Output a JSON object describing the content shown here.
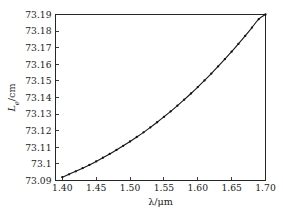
{
  "chart_data": {
    "type": "line",
    "title": "",
    "xlabel": "λ/μm",
    "ylabel": "L_e/cm",
    "ylabel_parts": {
      "symbol": "L",
      "subscript": "e",
      "unit": "/cm"
    },
    "xlabel_parts": {
      "symbol": "λ",
      "unit": "/μm"
    },
    "xlim": [
      1.39,
      1.7
    ],
    "ylim": [
      73.09,
      73.19
    ],
    "xticks": [
      1.4,
      1.45,
      1.5,
      1.55,
      1.6,
      1.65,
      1.7
    ],
    "xticklabels": [
      "1.40",
      "1.45",
      "1.50",
      "1.55",
      "1.60",
      "1.65",
      "1.70"
    ],
    "yticks": [
      73.09,
      73.1,
      73.11,
      73.12,
      73.13,
      73.14,
      73.15,
      73.16,
      73.17,
      73.18,
      73.19
    ],
    "yticklabels": [
      "73.09",
      "73.1",
      "73.11",
      "73.12",
      "73.13",
      "73.14",
      "73.15",
      "73.16",
      "73.17",
      "73.18",
      "73.19"
    ],
    "grid": false,
    "legend": null,
    "marker": "dot",
    "line_color": "#151515",
    "marker_color": "#111111",
    "frame_color": "#262626",
    "background": "#ffffff",
    "x": [
      1.4,
      1.41,
      1.42,
      1.43,
      1.44,
      1.45,
      1.46,
      1.47,
      1.48,
      1.49,
      1.5,
      1.51,
      1.52,
      1.53,
      1.54,
      1.55,
      1.56,
      1.57,
      1.58,
      1.59,
      1.6,
      1.61,
      1.62,
      1.63,
      1.64,
      1.65,
      1.66,
      1.67,
      1.68,
      1.69,
      1.7
    ],
    "values": [
      73.092,
      73.0937,
      73.0955,
      73.0974,
      73.0994,
      73.1015,
      73.1037,
      73.106,
      73.1084,
      73.1109,
      73.1135,
      73.1162,
      73.119,
      73.122,
      73.1251,
      73.1283,
      73.1316,
      73.1351,
      73.1387,
      73.1424,
      73.1463,
      73.1503,
      73.1544,
      73.1587,
      73.1631,
      73.1676,
      73.1723,
      73.1771,
      73.1821,
      73.1872,
      73.19
    ],
    "series": [
      {
        "name": "Le vs lambda",
        "values": [
          73.092,
          73.0937,
          73.0955,
          73.0974,
          73.0994,
          73.1015,
          73.1037,
          73.106,
          73.1084,
          73.1109,
          73.1135,
          73.1162,
          73.119,
          73.122,
          73.1251,
          73.1283,
          73.1316,
          73.1351,
          73.1387,
          73.1424,
          73.1463,
          73.1503,
          73.1544,
          73.1587,
          73.1631,
          73.1676,
          73.1723,
          73.1771,
          73.1821,
          73.1872,
          73.19
        ]
      }
    ]
  }
}
